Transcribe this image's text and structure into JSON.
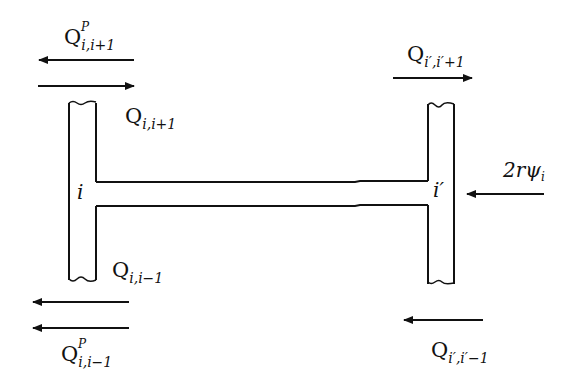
{
  "diagram": {
    "type": "flow-schematic",
    "nodes": {
      "left": {
        "label": "i"
      },
      "right": {
        "label": "i′"
      }
    },
    "flows": {
      "q_p_i_ip1": {
        "symbol": "Q",
        "sup": "P",
        "sub": "i,i+1",
        "direction": "left"
      },
      "q_i_ip1": {
        "symbol": "Q",
        "sub": "i,i+1",
        "direction": "right"
      },
      "q_i_im1": {
        "symbol": "Q",
        "sub": "i,i−1",
        "direction": "left"
      },
      "q_p_i_im1": {
        "symbol": "Q",
        "sup": "P",
        "sub": "i,i−1",
        "direction": "left"
      },
      "q_ip_ip1": {
        "symbol": "Q",
        "sub": "i′,i′+1",
        "direction": "right"
      },
      "q_ip_im1": {
        "symbol": "Q",
        "sub": "i′,i′−1",
        "direction": "left"
      },
      "source": {
        "text": "2rψ",
        "sub": "i",
        "direction": "left"
      }
    },
    "colors": {
      "line": "#111111",
      "background": "#ffffff"
    }
  }
}
